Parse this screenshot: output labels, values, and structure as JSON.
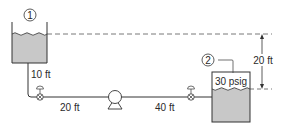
{
  "diagram": {
    "type": "pipe-flow-system",
    "colors": {
      "line": "#333333",
      "liquid": "#c8c8c8",
      "background": "#ffffff",
      "dash": "#555555"
    },
    "tank_1": {
      "label": "1"
    },
    "tank_2": {
      "label": "2",
      "pressure": "30 psig"
    },
    "pipe_segments": {
      "vertical_drop": "10 ft",
      "before_pump": "20 ft",
      "after_pump": "40 ft"
    },
    "elevation_difference": "20 ft",
    "components": [
      "tank-1",
      "valve-1",
      "pump",
      "valve-2",
      "tank-2"
    ]
  }
}
